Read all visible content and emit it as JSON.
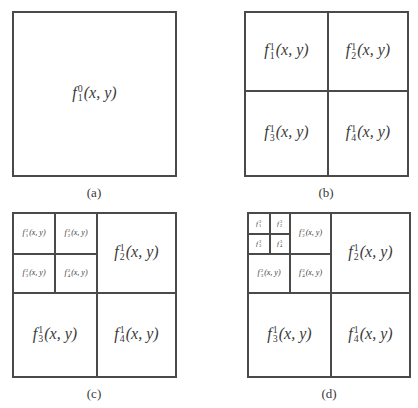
{
  "figure": {
    "panels": [
      {
        "id": "a",
        "caption": "(a)",
        "cells": [
          {
            "func": "f",
            "sup": "0",
            "sub": "1",
            "args": "(x, y)"
          }
        ]
      },
      {
        "id": "b",
        "caption": "(b)",
        "cells": [
          {
            "func": "f",
            "sup": "1",
            "sub": "1",
            "args": "(x, y)"
          },
          {
            "func": "f",
            "sup": "1",
            "sub": "2",
            "args": "(x, y)"
          },
          {
            "func": "f",
            "sup": "1",
            "sub": "3",
            "args": "(x, y)"
          },
          {
            "func": "f",
            "sup": "1",
            "sub": "4",
            "args": "(x, y)"
          }
        ]
      },
      {
        "id": "c",
        "caption": "(c)",
        "cells": [
          {
            "func": "f",
            "sup": "2",
            "sub": "1",
            "args": "(x, y)"
          },
          {
            "func": "f",
            "sup": "2",
            "sub": "2",
            "args": "(x, y)"
          },
          {
            "func": "f",
            "sup": "2",
            "sub": "3",
            "args": "(x, y)"
          },
          {
            "func": "f",
            "sup": "2",
            "sub": "4",
            "args": "(x, y)"
          },
          {
            "func": "f",
            "sup": "1",
            "sub": "2",
            "args": "(x, y)"
          },
          {
            "func": "f",
            "sup": "1",
            "sub": "3",
            "args": "(x, y)"
          },
          {
            "func": "f",
            "sup": "1",
            "sub": "4",
            "args": "(x, y)"
          }
        ]
      },
      {
        "id": "d",
        "caption": "(d)",
        "cells": [
          {
            "func": "f",
            "sup": "3",
            "sub": "1",
            "args": ""
          },
          {
            "func": "f",
            "sup": "3",
            "sub": "2",
            "args": ""
          },
          {
            "func": "f",
            "sup": "3",
            "sub": "3",
            "args": ""
          },
          {
            "func": "f",
            "sup": "3",
            "sub": "4",
            "args": ""
          },
          {
            "func": "f",
            "sup": "2",
            "sub": "2",
            "args": "(x, y)"
          },
          {
            "func": "f",
            "sup": "2",
            "sub": "3",
            "args": "(x, y)"
          },
          {
            "func": "f",
            "sup": "2",
            "sub": "4",
            "args": "(x, y)"
          },
          {
            "func": "f",
            "sup": "1",
            "sub": "2",
            "args": "(x, y)"
          },
          {
            "func": "f",
            "sup": "1",
            "sub": "3",
            "args": "(x, y)"
          },
          {
            "func": "f",
            "sup": "1",
            "sub": "4",
            "args": "(x, y)"
          }
        ]
      }
    ]
  }
}
